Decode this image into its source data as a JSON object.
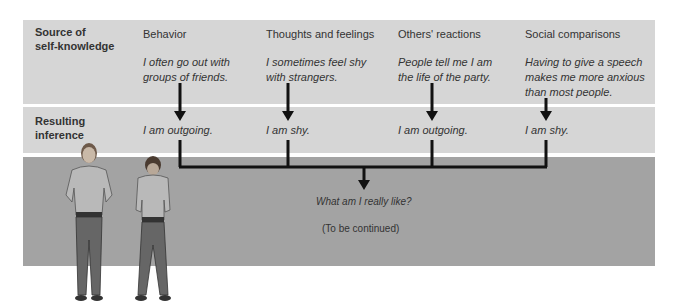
{
  "rows": {
    "source_label_line1": "Source of",
    "source_label_line2": "self-knowledge",
    "inference_label_line1": "Resulting",
    "inference_label_line2": "inference"
  },
  "columns": [
    {
      "heading": "Behavior",
      "example_line1": "I often go out with",
      "example_line2": "groups of friends.",
      "example_line3": "",
      "inference": "I am outgoing."
    },
    {
      "heading": "Thoughts and feelings",
      "example_line1": "I sometimes feel shy",
      "example_line2": "with strangers.",
      "example_line3": "",
      "inference": "I am shy."
    },
    {
      "heading": "Others' reactions",
      "example_line1": "People tell me I am",
      "example_line2": "the life of the party.",
      "example_line3": "",
      "inference": "I am outgoing."
    },
    {
      "heading": "Social comparisons",
      "example_line1": "Having to give a speech",
      "example_line2": "makes me more anxious",
      "example_line3": "than most people.",
      "inference": "I am shy."
    }
  ],
  "result": {
    "question": "What am I really like?",
    "continuation": "(To be continued)"
  },
  "colors": {
    "light_band": "#d6d6d6",
    "dark_band": "#a3a3a3",
    "line": "#111111"
  }
}
